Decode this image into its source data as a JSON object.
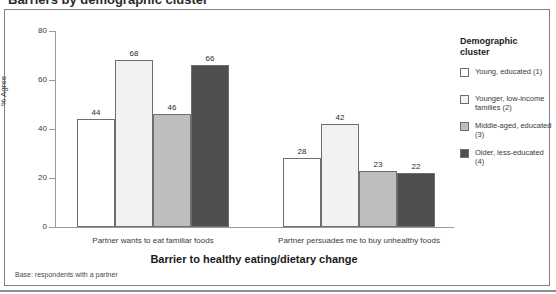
{
  "title_remnant": "Barriers by demographic cluster",
  "chart_data": {
    "type": "bar",
    "title": "",
    "xlabel": "Barrier to healthy eating/dietary change",
    "ylabel": "% Agree",
    "ylim": [
      0,
      80
    ],
    "yticks": [
      0,
      20,
      40,
      60,
      80
    ],
    "ytick_labels": [
      "0",
      "20",
      "40",
      "60",
      "80"
    ],
    "grid": false,
    "legend_position": "right",
    "categories": [
      "Partner wants to eat familiar foods",
      "Partner persuades me to buy unhealthy foods"
    ],
    "series": [
      {
        "name": "Young, educated (1)",
        "values": [
          44,
          28
        ],
        "color": "#ffffff"
      },
      {
        "name": "Younger, low-income families (2)",
        "values": [
          68,
          42
        ],
        "color": "#f2f2f2"
      },
      {
        "name": "Middle-aged, educated (3)",
        "values": [
          46,
          23
        ],
        "color": "#bebebe"
      },
      {
        "name": "Older, less-educated (4)",
        "values": [
          66,
          22
        ],
        "color": "#4f4f4f"
      }
    ],
    "value_labels": [
      [
        "44",
        "68",
        "46",
        "66"
      ],
      [
        "28",
        "42",
        "23",
        "22"
      ]
    ],
    "note": "Base: respondents with a partner"
  },
  "legend": {
    "title_line1": "Demographic",
    "title_line2": "cluster",
    "items": [
      {
        "label": "Young, educated (1)",
        "color": "#ffffff"
      },
      {
        "label": "Younger, low-income families (2)",
        "color": "#f2f2f2"
      },
      {
        "label": "Middle-aged, educated (3)",
        "color": "#bebebe"
      },
      {
        "label": "Older, less-educated (4)",
        "color": "#4f4f4f"
      }
    ]
  }
}
